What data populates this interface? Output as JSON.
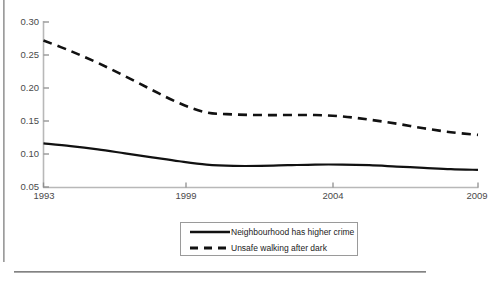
{
  "chart_data": {
    "type": "line",
    "title": "",
    "subtitle": "",
    "xlabel": "",
    "ylabel": "",
    "xlim": [
      1993,
      2009
    ],
    "ylim": [
      0.05,
      0.3
    ],
    "grid": false,
    "legend_position": "bottom-center",
    "x_tick_labels": [
      "1993",
      "1999",
      "2004",
      "2009"
    ],
    "x_ticks": [
      1993,
      1999,
      2004,
      2009
    ],
    "y_tick_labels": [
      "0.05",
      "0.10",
      "0.15",
      "0.20",
      "0.25",
      "0.30"
    ],
    "y_ticks": [
      0.05,
      0.1,
      0.15,
      0.2,
      0.25,
      0.3
    ],
    "series": [
      {
        "name": "Neighbourhood has higher crime",
        "style": "solid",
        "color": "#111111",
        "x": [
          1993,
          1994,
          1995,
          1996,
          1997,
          1998,
          1999,
          2000,
          2001,
          2002,
          2003,
          2004,
          2005,
          2006,
          2007,
          2008,
          2009
        ],
        "values": [
          0.116,
          0.112,
          0.107,
          0.101,
          0.095,
          0.089,
          0.084,
          0.082,
          0.082,
          0.083,
          0.084,
          0.084,
          0.083,
          0.081,
          0.079,
          0.077,
          0.076
        ]
      },
      {
        "name": "Unsafe walking after dark",
        "style": "dashed",
        "color": "#111111",
        "x": [
          1993,
          1994,
          1995,
          1996,
          1997,
          1998,
          1999,
          2000,
          2001,
          2002,
          2003,
          2004,
          2005,
          2006,
          2007,
          2008,
          2009
        ],
        "values": [
          0.272,
          0.256,
          0.238,
          0.218,
          0.197,
          0.177,
          0.163,
          0.16,
          0.159,
          0.159,
          0.159,
          0.157,
          0.152,
          0.146,
          0.139,
          0.133,
          0.129
        ]
      }
    ]
  },
  "legend": {
    "items": [
      {
        "label": "Neighbourhood has higher crime",
        "sample": "solid-line-sample"
      },
      {
        "label": "Unsafe walking after dark",
        "sample": "dashed-line-sample"
      }
    ]
  },
  "axes": {
    "y_labels": [
      "0.30",
      "0.25",
      "0.20",
      "0.15",
      "0.10",
      "0.05"
    ],
    "x_labels": [
      "1993",
      "1999",
      "2004",
      "2009"
    ]
  },
  "footnote": {
    "clipped_text": ""
  }
}
